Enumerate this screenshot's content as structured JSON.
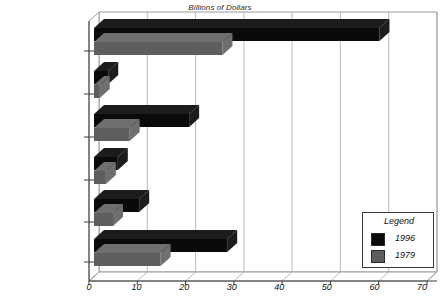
{
  "chart_data": {
    "type": "bar",
    "orientation": "horizontal",
    "title": "Billions of Dollars",
    "xlabel": "",
    "ylabel": "",
    "categories": [
      "Police",
      "Courts",
      "Prosecution",
      "Corrections",
      "Public Defenders",
      "Total"
    ],
    "series": [
      {
        "name": "1996",
        "color": "#0a0a0a",
        "values": [
          28,
          9.5,
          5,
          20,
          3,
          60
        ]
      },
      {
        "name": "1979",
        "color": "#5e5e5e",
        "values": [
          14,
          4,
          2.5,
          7.5,
          1.2,
          27
        ]
      }
    ],
    "xticks": [
      0,
      10,
      20,
      30,
      40,
      50,
      60,
      70
    ],
    "xlim": [
      0,
      70
    ],
    "grid": true,
    "legend": {
      "title": "Legend",
      "position": "bottom-right",
      "entries": [
        "1996",
        "1979"
      ]
    },
    "style": "3d-horizontal-bar"
  },
  "legend": {
    "title": "Legend",
    "entries": [
      {
        "label": "1996",
        "color": "#0a0a0a"
      },
      {
        "label": "1979",
        "color": "#5e5e5e"
      }
    ]
  }
}
